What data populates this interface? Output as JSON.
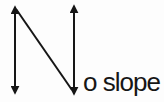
{
  "diagram": {
    "name": "no-slope-mnemonic",
    "label": "o slope",
    "line_color": "#161616",
    "text_color": "#161616",
    "background": "#fdfdfd",
    "stroke_width": 2,
    "lines": [
      {
        "name": "left-vertical-line-arrow",
        "x1": 15,
        "y1": 7,
        "x2": 15,
        "y2": 93,
        "head_start": true,
        "head_end": true
      },
      {
        "name": "diagonal-line",
        "x1": 16,
        "y1": 9,
        "x2": 72,
        "y2": 90,
        "head_start": false,
        "head_end": false
      },
      {
        "name": "right-vertical-line-arrow",
        "x1": 74,
        "y1": 6,
        "x2": 74,
        "y2": 94,
        "head_start": true,
        "head_end": true
      }
    ]
  }
}
